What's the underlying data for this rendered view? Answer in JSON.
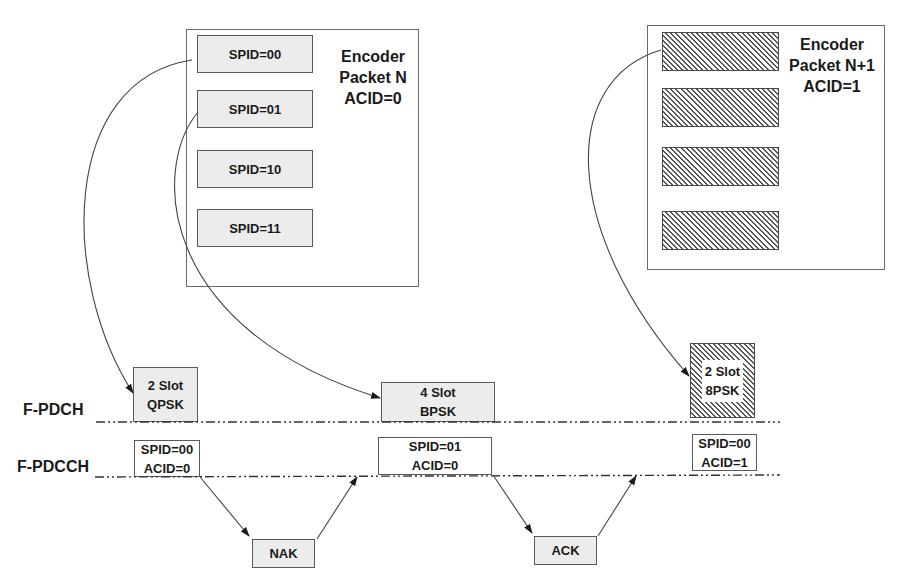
{
  "encoder_n": {
    "title_line1": "Encoder",
    "title_line2": "Packet N",
    "title_line3": "ACID=0",
    "subpackets": [
      "SPID=00",
      "SPID=01",
      "SPID=10",
      "SPID=11"
    ]
  },
  "encoder_n1": {
    "title_line1": "Encoder",
    "title_line2": "Packet N+1",
    "title_line3": "ACID=1",
    "subpackets_count": 4
  },
  "channels": {
    "pdch": "F-PDCH",
    "pdcch": "F-PDCCH"
  },
  "transmissions": [
    {
      "slot": "2 Slot",
      "modulation": "QPSK",
      "spid": "SPID=00",
      "acid": "ACID=0"
    },
    {
      "slot": "4 Slot",
      "modulation": "BPSK",
      "spid": "SPID=01",
      "acid": "ACID=0"
    },
    {
      "slot": "2 Slot",
      "modulation": "8PSK",
      "spid": "SPID=00",
      "acid": "ACID=1"
    }
  ],
  "feedback": [
    "NAK",
    "ACK"
  ]
}
